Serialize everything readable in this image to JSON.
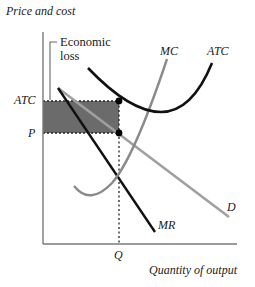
{
  "diagram": {
    "type": "monopoly-loss",
    "y_axis_label": "Price and cost",
    "x_axis_label": "Quantity of output",
    "annotation": {
      "line1": "Economic",
      "line2": "loss"
    },
    "price_labels": {
      "atc": "ATC",
      "p": "P"
    },
    "quantity_label": "Q",
    "curves": {
      "mc": "MC",
      "atc": "ATC",
      "d": "D",
      "mr": "MR"
    },
    "colors": {
      "loss_area": "#6b6b6b",
      "mc_curve": "#8a8a8a",
      "atc_curve": "#111111",
      "demand_curve": "#a0a0a0",
      "mr_curve": "#111111",
      "axis": "#7a7a7a"
    }
  }
}
